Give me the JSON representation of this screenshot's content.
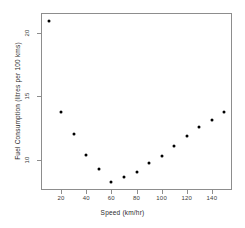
{
  "chart_data": {
    "type": "scatter",
    "title": "",
    "xlabel": "Speed (km/hr)",
    "ylabel": "Fuel Consumption (litres per 100 kms)",
    "x": [
      10,
      20,
      30,
      40,
      50,
      60,
      70,
      80,
      90,
      100,
      110,
      120,
      130,
      140,
      150
    ],
    "y": [
      21.0,
      13.8,
      12.0,
      10.4,
      9.3,
      8.2,
      8.6,
      9.0,
      9.7,
      10.3,
      11.1,
      11.9,
      12.6,
      13.1,
      13.8
    ],
    "points": [
      {
        "x": 10,
        "y": 21.0
      },
      {
        "x": 20,
        "y": 13.8
      },
      {
        "x": 30,
        "y": 12.0
      },
      {
        "x": 40,
        "y": 10.4
      },
      {
        "x": 50,
        "y": 9.3
      },
      {
        "x": 60,
        "y": 8.2
      },
      {
        "x": 70,
        "y": 8.6
      },
      {
        "x": 80,
        "y": 9.0
      },
      {
        "x": 90,
        "y": 9.7
      },
      {
        "x": 100,
        "y": 10.3
      },
      {
        "x": 110,
        "y": 11.1
      },
      {
        "x": 120,
        "y": 11.9
      },
      {
        "x": 130,
        "y": 12.6
      },
      {
        "x": 140,
        "y": 13.1
      },
      {
        "x": 150,
        "y": 13.8
      }
    ],
    "xlim": [
      4,
      156
    ],
    "ylim": [
      7.6,
      21.6
    ],
    "xticks": [
      20,
      40,
      60,
      80,
      100,
      120,
      140
    ],
    "xtick_labels": [
      "20",
      "40",
      "60",
      "80",
      "100",
      "120",
      "140"
    ],
    "yticks": [
      10,
      15,
      20
    ],
    "ytick_labels": [
      "10",
      "15",
      "20"
    ],
    "grid": false,
    "legend": null,
    "marker": "filled-circle",
    "marker_color": "#000000",
    "frame_color": "#8d8d8d",
    "background": "#ffffff"
  }
}
